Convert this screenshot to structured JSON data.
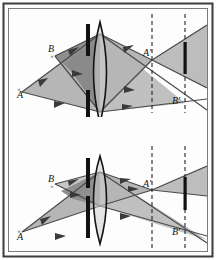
{
  "figure": {
    "background_color": "#fdfdfd",
    "frame": {
      "outer_color": "#3c3c3c",
      "inner_color": "#6e6e6e",
      "gap_color": "#ffffff"
    },
    "palette": {
      "cone_light": "#c3c3c3",
      "cone_mid": "#b0b0b0",
      "cone_overlap": "#8e8e8e",
      "ray_line": "#4a4a4a",
      "bar_black": "#111111",
      "lens_outline": "#1a1a1a",
      "lens_fill": "#cfcfcf",
      "dashed_line": "#2b2b2b",
      "label_color": "#1a1a1a"
    },
    "panels": [
      {
        "id": "panel-top",
        "name": "wide-aperture-diagram",
        "aperture": "wide",
        "labels": [
          {
            "id": "label-A",
            "text": "A",
            "x": 17,
            "y": 98
          },
          {
            "id": "label-B",
            "text": "B",
            "x": 48,
            "y": 52
          },
          {
            "id": "label-Ap",
            "text": "A'",
            "x": 146,
            "y": 56
          },
          {
            "id": "label-Bp",
            "text": "B'",
            "x": 176,
            "y": 101
          }
        ],
        "elements": {
          "stop_bar_x": 88,
          "lens_x": 100,
          "dashed_line_1_x": 152,
          "dashed_line_2_x": 185,
          "image_bar_x": 185
        }
      },
      {
        "id": "panel-bottom",
        "name": "narrow-aperture-diagram",
        "aperture": "narrow",
        "labels": [
          {
            "id": "label-A",
            "text": "A",
            "x": 17,
            "y": 240
          },
          {
            "id": "label-B",
            "text": "B",
            "x": 48,
            "y": 183
          },
          {
            "id": "label-Ap",
            "text": "A'",
            "x": 146,
            "y": 189
          },
          {
            "id": "label-Bp",
            "text": "B'",
            "x": 176,
            "y": 232
          }
        ],
        "elements": {
          "stop_bar_x": 88,
          "lens_x": 100,
          "dashed_line_1_x": 152,
          "dashed_line_2_x": 185,
          "image_bar_x": 185
        }
      }
    ]
  }
}
